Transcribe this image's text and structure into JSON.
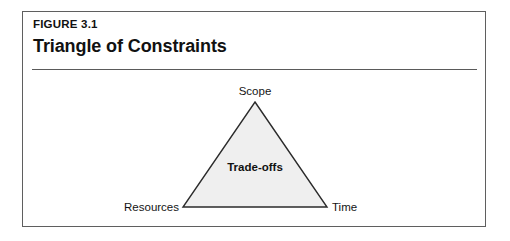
{
  "figure": {
    "eyebrow": "FIGURE 3.1",
    "title": "Triangle of Constraints"
  },
  "diagram": {
    "type": "triangle",
    "center_label": "Trade-offs",
    "vertices": [
      {
        "id": "scope",
        "label": "Scope",
        "position": "top"
      },
      {
        "id": "resources",
        "label": "Resources",
        "position": "bottom-left"
      },
      {
        "id": "time",
        "label": "Time",
        "position": "bottom-right"
      }
    ]
  },
  "colors": {
    "page_background": "#ffffff",
    "frame_border": "#5f5f5f",
    "rule": "#5a5a5a",
    "triangle_fill": "#efefef",
    "triangle_stroke": "#2b2b2b",
    "text": "#111111"
  }
}
